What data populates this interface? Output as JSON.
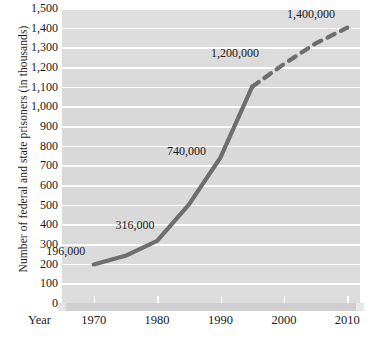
{
  "chart_data": {
    "type": "line",
    "title": "",
    "xlabel": "Year",
    "ylabel": "Number of federal and state prisoners (in thousands)",
    "xlim": [
      1965,
      2012
    ],
    "ylim": [
      0,
      1500
    ],
    "grid": true,
    "legend": "none",
    "x_ticks": [
      "1970",
      "1980",
      "1990",
      "2000",
      "2010"
    ],
    "x_tick_values": [
      1970,
      1980,
      1990,
      2000,
      2010
    ],
    "y_ticks": [
      "0",
      "100",
      "200",
      "300",
      "400",
      "500",
      "600",
      "700",
      "800",
      "900",
      "1,000",
      "1,100",
      "1,200",
      "1,300",
      "1,400",
      "1,500"
    ],
    "y_tick_values": [
      0,
      100,
      200,
      300,
      400,
      500,
      600,
      700,
      800,
      900,
      1000,
      1100,
      1200,
      1300,
      1400,
      1500
    ],
    "series": [
      {
        "name": "actual",
        "style": "solid",
        "color": "#6e6e6e",
        "x": [
          1970,
          1975,
          1980,
          1985,
          1990,
          1995
        ],
        "values": [
          196,
          240,
          316,
          500,
          740,
          1100
        ]
      },
      {
        "name": "projected",
        "style": "dashed",
        "color": "#6e6e6e",
        "x": [
          1995,
          2000,
          2005,
          2010
        ],
        "values": [
          1100,
          1215,
          1320,
          1400
        ]
      }
    ],
    "annotations": [
      {
        "text": "196,000",
        "x": 1970,
        "y": 196
      },
      {
        "text": "316,000",
        "x": 1980,
        "y": 316
      },
      {
        "text": "740,000",
        "x": 1990,
        "y": 740
      },
      {
        "text": "1,200,000",
        "x": 1997,
        "y": 1200
      },
      {
        "text": "1,400,000",
        "x": 2009,
        "y": 1400
      }
    ],
    "colors": {
      "plot_background": "#d9d9d9",
      "gridline": "#ffffff",
      "line": "#6e6e6e",
      "text": "#1a1a1a",
      "page_background": "#ffffff"
    }
  }
}
